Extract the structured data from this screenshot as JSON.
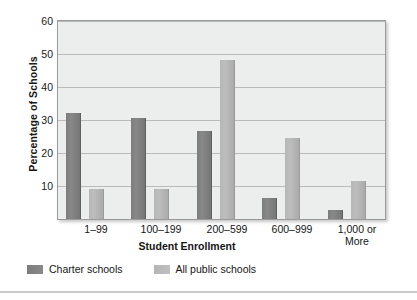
{
  "chart_data": {
    "type": "bar",
    "title": "",
    "xlabel": "Student Enrollment",
    "ylabel": "Percentage of Schools",
    "categories": [
      "1–99",
      "100–199",
      "200–599",
      "600–999",
      "1,000 or More"
    ],
    "series": [
      {
        "name": "Charter schools",
        "color": "#808080",
        "values": [
          32.0,
          30.5,
          26.7,
          6.4,
          2.6
        ]
      },
      {
        "name": "All public schools",
        "color": "#b8b8b8",
        "values": [
          9.0,
          9.0,
          48.2,
          24.5,
          11.4
        ]
      }
    ],
    "ylim": [
      0,
      60
    ],
    "yticks": [
      60,
      50,
      40,
      30,
      20,
      10
    ],
    "ytick_labels": [
      "60",
      "50",
      "40",
      "30",
      "20",
      "10"
    ],
    "grid": true,
    "legend_position": "bottom-left",
    "plot_background": "#eceded",
    "gridline_color": "#b9bbbb"
  },
  "axis": {
    "y_title": "Percentage of Schools",
    "x_title": "Student Enrollment"
  },
  "xticks": [
    {
      "line1": "1–99",
      "line2": ""
    },
    {
      "line1": "100–199",
      "line2": ""
    },
    {
      "line1": "200–599",
      "line2": ""
    },
    {
      "line1": "600–999",
      "line2": ""
    },
    {
      "line1": "1,000 or",
      "line2": "More"
    }
  ],
  "legend": {
    "items": [
      {
        "label": "Charter schools"
      },
      {
        "label": "All public schools"
      }
    ]
  }
}
